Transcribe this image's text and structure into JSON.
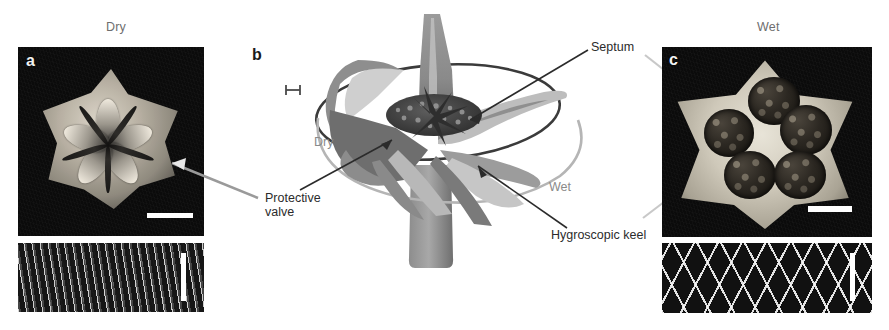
{
  "figure": {
    "width": 889,
    "height": 330,
    "background": "#ffffff"
  },
  "columns": {
    "left_title": "Dry",
    "right_title": "Wet"
  },
  "panels": [
    {
      "letter": "a",
      "title": "Dry",
      "letter_color": "#f2f2f2",
      "kind": "photograph",
      "inset_kind": "sem-fibrous",
      "has_scalebar": true
    },
    {
      "letter": "b",
      "title": "",
      "letter_color": "#1a1a1a",
      "kind": "schematic",
      "has_scalebar": true
    },
    {
      "letter": "c",
      "title": "Wet",
      "letter_color": "#f2f2f2",
      "kind": "photograph",
      "inset_kind": "sem-mesh",
      "has_scalebar": true
    }
  ],
  "diagram": {
    "state_labels": [
      {
        "text": "Dry",
        "color": "#8a8a8a"
      },
      {
        "text": "Wet",
        "color": "#8a8a8a"
      }
    ],
    "callouts": [
      {
        "text": "Septum",
        "color": "#2b2b2b"
      },
      {
        "text": "Protective\nvalve",
        "color": "#2b2b2b"
      },
      {
        "text": "Hygroscopic keel",
        "color": "#2b2b2b"
      }
    ],
    "palette": {
      "light_gray": "#c9c9c9",
      "mid_gray": "#9a9a9a",
      "dark_gray": "#6f6f6f",
      "deep_gray": "#4a4a4a",
      "seed_dark": "#3a3a3a",
      "outline": "#2a2a2a"
    }
  }
}
